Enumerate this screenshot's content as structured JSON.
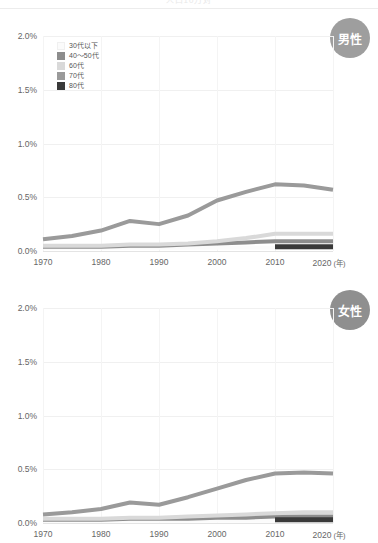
{
  "header": {
    "cropped_title": "人口10万対"
  },
  "axis": {
    "y_ticks": [
      "2.0%",
      "1.5%",
      "1.0%",
      "0.5%",
      "0.0%"
    ],
    "y_values": [
      2.0,
      1.5,
      1.0,
      0.5,
      0.0
    ],
    "x_ticks": [
      "1970",
      "1980",
      "1990",
      "2000",
      "2010",
      "2020"
    ],
    "x_values": [
      1970,
      1980,
      1990,
      2000,
      2010,
      2020
    ],
    "x_unit": "(年)"
  },
  "legend": {
    "items": [
      {
        "label": "30代以下",
        "color": "#fbfbfb"
      },
      {
        "label": "40〜50代",
        "color": "#8d8d8d"
      },
      {
        "label": "60代",
        "color": "#d9d9d9"
      },
      {
        "label": "70代",
        "color": "#9a9a9a"
      },
      {
        "label": "80代",
        "color": "#3a3a3a"
      }
    ]
  },
  "panels": [
    {
      "badge_label": "男性",
      "badge_color": "#9e9e9e"
    },
    {
      "badge_label": "女性",
      "badge_color": "#8f8f8f"
    }
  ],
  "chart_data": [
    {
      "type": "line",
      "title": "男性",
      "xlabel": "(年)",
      "ylabel": "",
      "xlim": [
        1970,
        2020
      ],
      "ylim": [
        0.0,
        2.0
      ],
      "grid": true,
      "legend_position": "top-left",
      "x": [
        1970,
        1975,
        1980,
        1985,
        1990,
        1995,
        2000,
        2005,
        2010,
        2015,
        2020
      ],
      "series": [
        {
          "name": "30代以下",
          "color": "#fbfbfb",
          "values": [
            0.03,
            0.03,
            0.03,
            0.03,
            0.03,
            0.03,
            0.03,
            0.03,
            0.03,
            0.03,
            0.03
          ]
        },
        {
          "name": "40〜50代",
          "color": "#8d8d8d",
          "values": [
            0.04,
            0.04,
            0.04,
            0.05,
            0.05,
            0.06,
            0.07,
            0.08,
            0.09,
            0.09,
            0.09
          ]
        },
        {
          "name": "60代",
          "color": "#d9d9d9",
          "values": [
            0.05,
            0.05,
            0.05,
            0.06,
            0.06,
            0.07,
            0.09,
            0.12,
            0.16,
            0.16,
            0.16
          ]
        },
        {
          "name": "70代",
          "color": "#9a9a9a",
          "values": [
            0.11,
            0.14,
            0.19,
            0.28,
            0.25,
            0.33,
            0.47,
            0.55,
            0.62,
            0.61,
            0.57
          ]
        },
        {
          "name": "80代",
          "color": "#3a3a3a",
          "values": [
            null,
            null,
            null,
            null,
            null,
            null,
            null,
            null,
            0.04,
            0.04,
            0.04
          ]
        }
      ]
    },
    {
      "type": "line",
      "title": "女性",
      "xlabel": "(年)",
      "ylabel": "",
      "xlim": [
        1970,
        2020
      ],
      "ylim": [
        0.0,
        2.0
      ],
      "grid": true,
      "legend_position": "none",
      "x": [
        1970,
        1975,
        1980,
        1985,
        1990,
        1995,
        2000,
        2005,
        2010,
        2015,
        2020
      ],
      "series": [
        {
          "name": "30代以下",
          "color": "#fbfbfb",
          "values": [
            0.02,
            0.02,
            0.02,
            0.02,
            0.02,
            0.02,
            0.02,
            0.02,
            0.02,
            0.02,
            0.02
          ]
        },
        {
          "name": "40〜50代",
          "color": "#8d8d8d",
          "values": [
            0.03,
            0.03,
            0.03,
            0.04,
            0.04,
            0.04,
            0.05,
            0.05,
            0.06,
            0.06,
            0.06
          ]
        },
        {
          "name": "60代",
          "color": "#d9d9d9",
          "values": [
            0.04,
            0.04,
            0.04,
            0.05,
            0.05,
            0.06,
            0.07,
            0.08,
            0.09,
            0.1,
            0.1
          ]
        },
        {
          "name": "70代",
          "color": "#9a9a9a",
          "values": [
            0.08,
            0.1,
            0.13,
            0.19,
            0.17,
            0.24,
            0.32,
            0.4,
            0.46,
            0.47,
            0.46
          ]
        },
        {
          "name": "80代",
          "color": "#3a3a3a",
          "values": [
            null,
            null,
            null,
            null,
            null,
            null,
            null,
            null,
            0.03,
            0.03,
            0.03
          ]
        }
      ]
    }
  ]
}
